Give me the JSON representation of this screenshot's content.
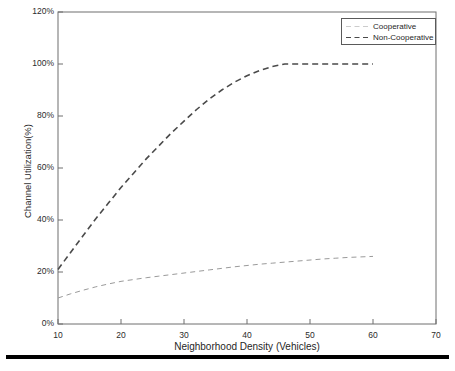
{
  "chart_data": {
    "type": "line",
    "title": "",
    "subtitle": "",
    "xlabel": "Neighborhood Density (Vehicles)",
    "ylabel": "Channel Utilization(%)",
    "xlim": [
      10,
      70
    ],
    "ylim": [
      0,
      120
    ],
    "xticks": [
      10,
      20,
      30,
      40,
      50,
      60,
      70
    ],
    "xtick_labels": [
      "10",
      "20",
      "30",
      "40",
      "50",
      "60",
      "70"
    ],
    "yticks": [
      0,
      20,
      40,
      60,
      80,
      100,
      120
    ],
    "ytick_labels": [
      "0%",
      "20%",
      "40%",
      "60%",
      "80%",
      "100%",
      "120%"
    ],
    "grid": false,
    "legend_position": "top-right",
    "series": [
      {
        "name": "Cooperative",
        "color": "#9a9a9a",
        "linestyle": "dashed",
        "linewidth": 1,
        "x": [
          10,
          12,
          14,
          16,
          18,
          20,
          22,
          24,
          26,
          28,
          30,
          32,
          34,
          36,
          38,
          40,
          42,
          44,
          46,
          48,
          50,
          52,
          54,
          56,
          58,
          60
        ],
        "y": [
          10.0,
          11.6,
          13.0,
          14.3,
          15.4,
          16.4,
          17.1,
          17.8,
          18.4,
          19.0,
          19.6,
          20.2,
          20.8,
          21.4,
          22.0,
          22.5,
          23.0,
          23.4,
          23.8,
          24.2,
          24.6,
          25.0,
          25.3,
          25.6,
          25.8,
          26.0
        ]
      },
      {
        "name": "Non-Cooperative",
        "color": "#4a4a4a",
        "linestyle": "dashed",
        "linewidth": 1.6,
        "x": [
          10,
          12,
          14,
          16,
          18,
          20,
          22,
          24,
          26,
          28,
          30,
          32,
          34,
          36,
          38,
          40,
          42,
          44,
          46,
          48,
          50,
          52,
          54,
          56,
          58,
          60
        ],
        "y": [
          21.0,
          27.5,
          34.0,
          40.5,
          46.5,
          52.5,
          58.0,
          63.5,
          68.5,
          73.5,
          78.0,
          82.5,
          86.5,
          90.0,
          93.0,
          95.5,
          97.5,
          99.0,
          100.0,
          100.0,
          100.0,
          100.0,
          100.0,
          100.0,
          100.0,
          100.0
        ]
      }
    ]
  },
  "legend": {
    "entries": [
      {
        "label": "Cooperative"
      },
      {
        "label": "Non-Cooperative"
      }
    ]
  },
  "axes": {
    "x_label": "Neighborhood Density (Vehicles)",
    "y_label": "Channel Utilization(%)"
  }
}
